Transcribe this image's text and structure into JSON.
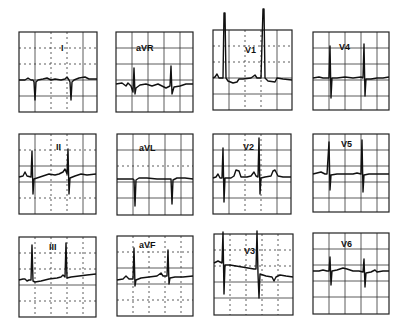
{
  "leads": [
    {
      "id": "I",
      "label": "I",
      "row": 0,
      "col": 0
    },
    {
      "id": "aVR",
      "label": "aVR",
      "row": 0,
      "col": 1
    },
    {
      "id": "V1",
      "label": "V1",
      "row": 0,
      "col": 2
    },
    {
      "id": "V4",
      "label": "V4",
      "row": 0,
      "col": 3
    },
    {
      "id": "II",
      "label": "II",
      "row": 1,
      "col": 0
    },
    {
      "id": "aVL",
      "label": "aVL",
      "row": 1,
      "col": 1
    },
    {
      "id": "V2",
      "label": "V2",
      "row": 1,
      "col": 2
    },
    {
      "id": "V5",
      "label": "V5",
      "row": 1,
      "col": 3
    },
    {
      "id": "III",
      "label": "III",
      "row": 2,
      "col": 0
    },
    {
      "id": "aVF",
      "label": "aVF",
      "row": 2,
      "col": 1
    },
    {
      "id": "V3",
      "label": "V3",
      "row": 2,
      "col": 2
    },
    {
      "id": "V6",
      "label": "V6",
      "row": 2,
      "col": 3
    }
  ],
  "colors": {
    "trace": "#111111",
    "grid": "#333333",
    "background": "#ffffff"
  }
}
